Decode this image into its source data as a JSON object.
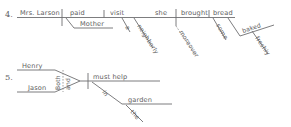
{
  "page": {
    "background_color": "#ffffff",
    "ink_color": "#6e6e70"
  },
  "exercises": [
    {
      "number": "4.",
      "sentence": "Mrs. Larson paid Mother a neighborly visit; moreover, she brought some freshly baked bread.",
      "words": {
        "subject": "Mrs. Larson",
        "verb": "paid",
        "indirect_object": "Mother",
        "direct_object": "visit",
        "article": "a",
        "adjective": "neighborly",
        "conjunctive_adverb": "moreover",
        "subject2": "she",
        "verb2": "brought",
        "direct_object2": "bread",
        "adjective2": "some",
        "adjective3": "baked",
        "adverb2": "freshly"
      }
    },
    {
      "number": "5.",
      "sentence": "Both Henry and Jason must help in the garden.",
      "words": {
        "subject_a": "Henry",
        "subject_b": "Jason",
        "correlative_first": "Both",
        "correlative_second": "and",
        "verb": "must help",
        "preposition": "in",
        "article": "the",
        "object_of_preposition": "garden"
      }
    }
  ]
}
